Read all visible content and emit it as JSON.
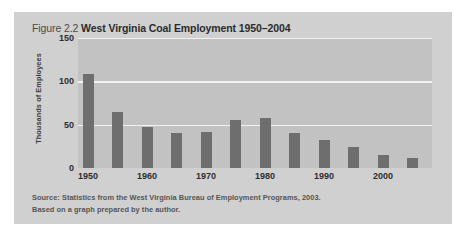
{
  "figure": {
    "number_label": "Figure 2.2",
    "title": "West Virginia Coal Employment 1950–2004",
    "source_line1": "Source: Statistics from the West Virginia Bureau of Employment Programs, 2003.",
    "source_line2": "Based on a graph prepared by the author."
  },
  "colors": {
    "panel_background": "#d0d0d0",
    "plot_background": "#c2c2c2",
    "bar": "#6e6e6e",
    "gridline": "#f2f2f2",
    "title_text": "#2b2b2b",
    "source_text": "#555555"
  },
  "chart_data": {
    "type": "bar",
    "title": "West Virginia Coal Employment 1950–2004",
    "xlabel": "",
    "ylabel": "Thousands of Employees",
    "ylim": [
      0,
      150
    ],
    "yticks": [
      0,
      50,
      100,
      150
    ],
    "ytick_labels": [
      "0",
      "50",
      "100",
      "150"
    ],
    "grid": true,
    "legend": false,
    "categories": [
      "1950",
      "1955",
      "1960",
      "1965",
      "1970",
      "1975",
      "1980",
      "1985",
      "1990",
      "1995",
      "2000",
      "2004"
    ],
    "values": [
      108,
      65,
      47,
      40,
      41,
      55,
      58,
      40,
      32,
      24,
      15,
      12
    ],
    "xtick_labels": [
      "1950",
      "1960",
      "1970",
      "1980",
      "1990",
      "2000"
    ],
    "xtick_categories": [
      "1950",
      "1960",
      "1970",
      "1980",
      "1990",
      "2000"
    ]
  }
}
